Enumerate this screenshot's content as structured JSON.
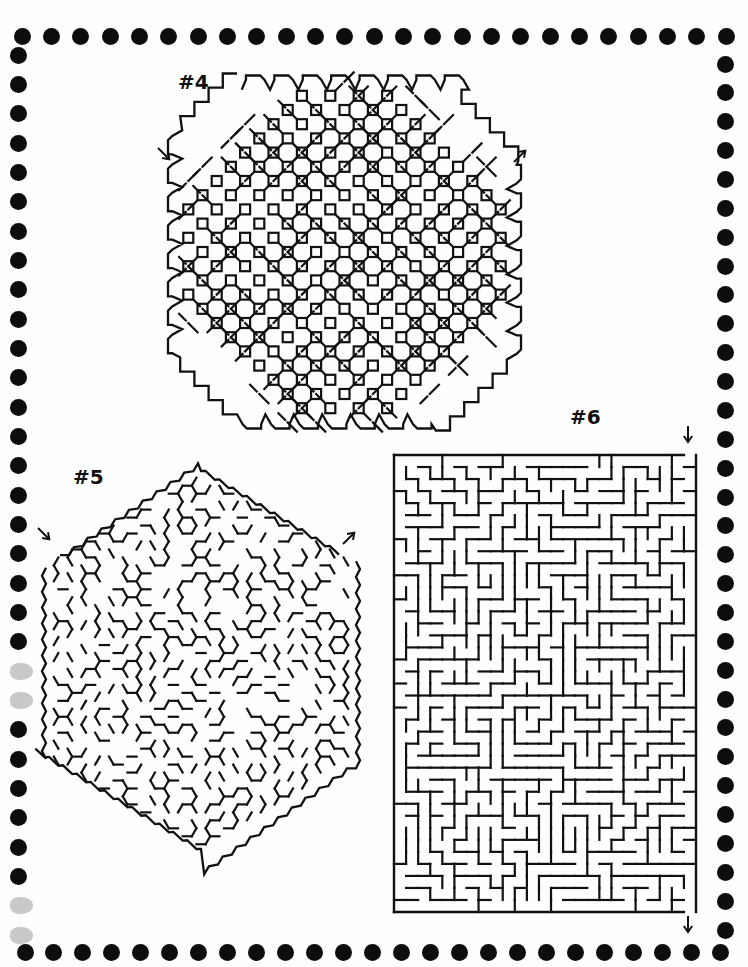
{
  "page": {
    "background": "#fefefe",
    "ink": "#111111",
    "border": {
      "dot_color": "#0d0d0d",
      "faded_color": "#c9c9c9",
      "top": {
        "y": 36,
        "x_start": 22,
        "x_end": 726,
        "count": 25,
        "size": 17
      },
      "bottom": {
        "y": 952,
        "x_start": 25,
        "x_end": 720,
        "count": 25,
        "size": 17
      },
      "left": {
        "x": 18,
        "y_start": 55,
        "y_end": 935,
        "count": 31,
        "size": 17,
        "faded_indices": [
          21,
          22,
          29,
          30
        ]
      },
      "right": {
        "x": 725,
        "y_start": 64,
        "y_end": 930,
        "count": 31,
        "size": 17
      }
    }
  },
  "mazes": [
    {
      "id": "maze-4",
      "label": "#4",
      "label_pos": {
        "x": 178,
        "y": 70
      },
      "shape": "octagon-diamond-lattice",
      "bounds": {
        "x": 162,
        "y": 72,
        "w": 365,
        "h": 360
      },
      "entry_arrow": {
        "x": 158,
        "y": 148,
        "dir": "down-right",
        "glyph": "↘"
      },
      "exit_arrow": {
        "x": 514,
        "y": 146,
        "dir": "up-right",
        "glyph": "↗"
      }
    },
    {
      "id": "maze-5",
      "label": "#5",
      "label_pos": {
        "x": 73,
        "y": 465
      },
      "shape": "hexagon-hex-grid",
      "bounds": {
        "x": 42,
        "y": 465,
        "w": 318,
        "h": 392
      },
      "entry_arrow": {
        "x": 38,
        "y": 528,
        "dir": "down-right",
        "glyph": "↘"
      },
      "exit_arrow": {
        "x": 343,
        "y": 530,
        "dir": "up-right",
        "glyph": "↗"
      }
    },
    {
      "id": "maze-6",
      "label": "#6",
      "label_pos": {
        "x": 570,
        "y": 405
      },
      "shape": "rectangle-square-grid",
      "bounds": {
        "x": 394,
        "y": 455,
        "w": 302,
        "h": 457
      },
      "cell": 12.1,
      "entry_arrow": {
        "x": 683,
        "y": 426,
        "dir": "down",
        "glyph": "↓"
      },
      "exit_arrow": {
        "x": 683,
        "y": 912,
        "dir": "down",
        "glyph": "↓"
      }
    }
  ]
}
